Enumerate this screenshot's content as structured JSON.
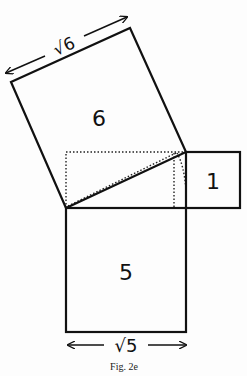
{
  "figure": {
    "caption": "Fig. 2e",
    "squares": [
      {
        "id": "tilted",
        "area_label": "6",
        "side_label": "√6"
      },
      {
        "id": "small",
        "area_label": "1"
      },
      {
        "id": "bottom",
        "area_label": "5",
        "side_label": "√5"
      }
    ],
    "colors": {
      "stroke": "#111111",
      "background": "#fdfdfd"
    }
  }
}
